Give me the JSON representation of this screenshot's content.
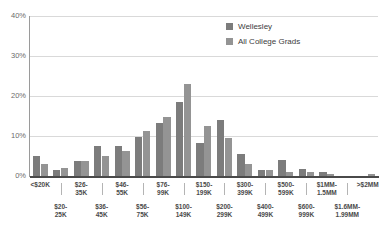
{
  "chart_data": {
    "type": "bar",
    "title": "",
    "subtitle": "",
    "xlabel": "",
    "ylabel": "",
    "ylim": [
      0,
      40
    ],
    "yticks": [
      0,
      10,
      20,
      30,
      40
    ],
    "ytick_labels": [
      "0%",
      "10%",
      "20%",
      "30%",
      "40%"
    ],
    "grid": "horizontal",
    "legend_position": "top-right",
    "units": "percent",
    "categories": [
      "<$20K",
      "$20-25K",
      "$26-35K",
      "$36-45K",
      "$46-55K",
      "$56-75K",
      "$76-99K",
      "$100-149K",
      "$150-199K",
      "$200-299K",
      "$300-399K",
      "$400-499K",
      "$500-599K",
      "$600-999K",
      "$1MM-1.5MM",
      "$1.6MM-1.99MM",
      ">$2MM"
    ],
    "category_rows": [
      {
        "label": "<$20K",
        "row": 0
      },
      {
        "label": "$20-25K",
        "row": 1
      },
      {
        "label": "$26-35K",
        "row": 0
      },
      {
        "label": "$36-45K",
        "row": 1
      },
      {
        "label": "$46-55K",
        "row": 0
      },
      {
        "label": "$56-75K",
        "row": 1
      },
      {
        "label": "$76-99K",
        "row": 0
      },
      {
        "label": "$100-149K",
        "row": 1
      },
      {
        "label": "$150-199K",
        "row": 0
      },
      {
        "label": "$200-299K",
        "row": 1
      },
      {
        "label": "$300-399K",
        "row": 0
      },
      {
        "label": "$400-499K",
        "row": 1
      },
      {
        "label": "$500-599K",
        "row": 0
      },
      {
        "label": "$600-999K",
        "row": 1
      },
      {
        "label": "$1MM-1.5MM",
        "row": 0
      },
      {
        "label": "$1.6MM-1.99MM",
        "row": 1
      },
      {
        "label": ">$2MM",
        "row": 0
      }
    ],
    "series": [
      {
        "name": "Wellesley",
        "color": "#7c7c7c",
        "values": [
          5.0,
          1.5,
          3.7,
          7.4,
          7.4,
          9.7,
          13.3,
          18.5,
          8.3,
          14.1,
          5.4,
          1.6,
          4.0,
          1.7,
          0.9,
          0.1,
          0.0
        ]
      },
      {
        "name": "All College Grads",
        "color": "#949494",
        "values": [
          3.1,
          1.9,
          3.7,
          5.1,
          6.2,
          11.2,
          14.8,
          23.0,
          12.4,
          9.6,
          3.0,
          1.4,
          1.0,
          1.1,
          0.6,
          0.1,
          0.4
        ]
      }
    ]
  },
  "legend": {
    "items": [
      {
        "label": "Wellesley",
        "swatch": "#7c7c7c"
      },
      {
        "label": "All College Grads",
        "swatch": "#949494"
      }
    ]
  },
  "axis": {
    "y_labels": [
      "40%",
      "30%",
      "20%",
      "10%",
      "0%"
    ]
  }
}
